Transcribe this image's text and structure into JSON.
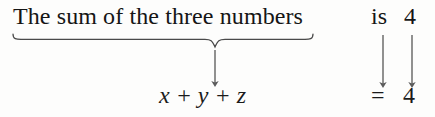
{
  "figure": {
    "kind": "math-translation-diagram",
    "background_color": "#fdfdfc",
    "ink_color": "#1a1a1a",
    "width": 435,
    "height": 117
  },
  "sentence": {
    "braced_phrase": "The sum of the three numbers",
    "linking_verb": "is",
    "stated_value": "4"
  },
  "equation": {
    "expression": "x + y + z",
    "relation": "=",
    "value": "4"
  },
  "annotations": {
    "brace": {
      "name": "underbrace",
      "orientation": "down",
      "left_x": 13,
      "right_x": 313,
      "apex_x": 215,
      "top_y": 34,
      "apex_y": 47,
      "stroke": "#4a4a4a"
    },
    "arrows": [
      {
        "name": "phrase-to-expression-arrow",
        "x": 215,
        "from_y": 50,
        "to_y": 86,
        "maps": "The sum of the three numbers -> x + y + z"
      },
      {
        "name": "is-to-equals-arrow",
        "x": 383,
        "from_y": 35,
        "to_y": 87,
        "maps": "is -> ="
      },
      {
        "name": "value-to-value-arrow",
        "x": 412,
        "from_y": 35,
        "to_y": 87,
        "maps": "4 -> 4"
      }
    ],
    "arrow_stroke": "#5c5c5c"
  }
}
